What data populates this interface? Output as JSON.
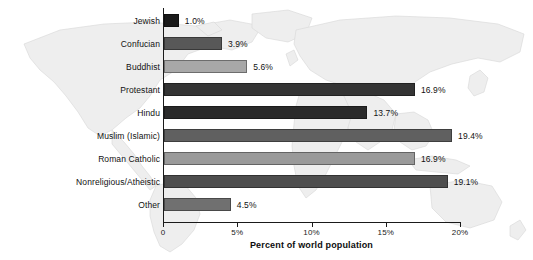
{
  "chart_data": {
    "type": "bar",
    "orientation": "horizontal",
    "title": "",
    "subtitle": "",
    "xlabel": "Percent of world population",
    "ylabel": "",
    "xlim": [
      0,
      20
    ],
    "xticks": [
      "0",
      "5%",
      "10%",
      "15%",
      "20%"
    ],
    "xtick_values": [
      0,
      5,
      10,
      15,
      20
    ],
    "grid": false,
    "legend": "none",
    "background": "world-map-watermark",
    "categories": [
      "Jewish",
      "Confucian",
      "Buddhist",
      "Protestant",
      "Hindu",
      "Muslim (Islamic)",
      "Roman Catholic",
      "Nonreligious/Atheistic",
      "Other"
    ],
    "values": [
      1.0,
      3.9,
      5.6,
      16.9,
      13.7,
      19.4,
      16.9,
      19.1,
      4.5
    ],
    "value_labels": [
      "1.0%",
      "3.9%",
      "5.6%",
      "16.9%",
      "13.7%",
      "19.4%",
      "16.9%",
      "19.1%",
      "4.5%"
    ],
    "bar_colors": [
      "#1a1a1a",
      "#585858",
      "#a8a8a8",
      "#343434",
      "#2a2a2a",
      "#606060",
      "#9a9a9a",
      "#4e4e4e",
      "#707070"
    ]
  },
  "colors": {
    "axis": "#1a1a1a",
    "text": "#111111",
    "map_fill": "#efefef",
    "map_stroke": "#d2d2d2"
  }
}
